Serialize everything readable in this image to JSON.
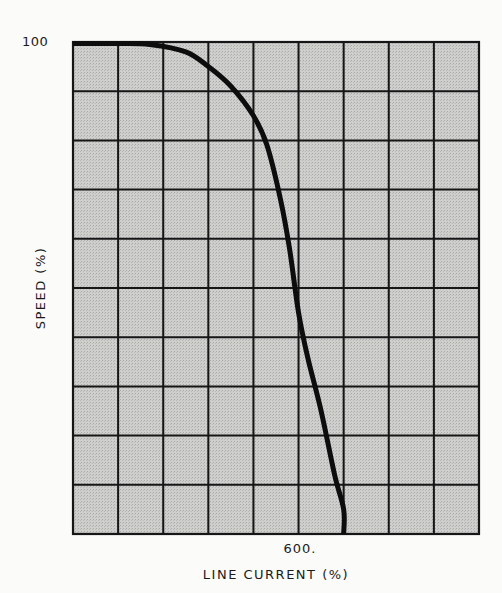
{
  "chart_data": {
    "type": "line",
    "title": "",
    "xlabel": "LINE CURRENT (%)",
    "ylabel": "SPEED (%)",
    "xlim": [
      0,
      900
    ],
    "ylim": [
      0,
      100
    ],
    "x_tick_labels": [
      {
        "value": 600,
        "label": "600."
      }
    ],
    "y_tick_labels": [
      {
        "value": 100,
        "label": "100"
      }
    ],
    "grid": {
      "on": true,
      "x_divisions": 9,
      "y_divisions": 10
    },
    "series": [
      {
        "name": "speed-current characteristic",
        "x": [
          0,
          100,
          170,
          250,
          300,
          350,
          400,
          430,
          460,
          480,
          500,
          520,
          550,
          580,
          600,
          600
        ],
        "y": [
          100,
          100,
          99.5,
          98,
          95,
          91,
          85,
          79,
          68,
          58,
          45,
          36,
          25,
          12,
          5,
          0
        ]
      }
    ]
  },
  "style": {
    "plot_background": "#c9c9c7",
    "grid_color": "#161616",
    "curve_color": "#0d0d0d",
    "page_background": "#fbfbfa"
  },
  "labels": {
    "y_top": "100",
    "x_600": "600.",
    "x_axis": "LINE CURRENT (%)",
    "y_axis": "SPEED (%)"
  }
}
